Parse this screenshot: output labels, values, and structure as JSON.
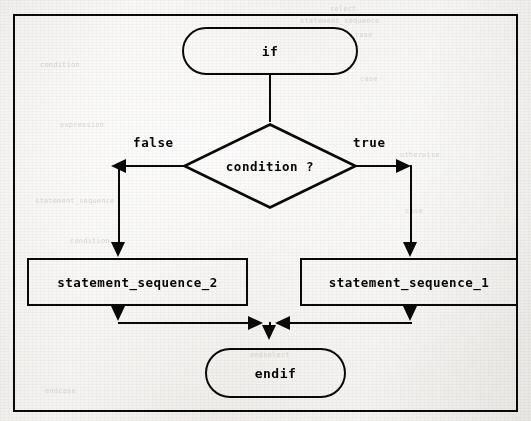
{
  "figure": {
    "kind": "flowchart",
    "frame_color": "#111111",
    "ink_color": "#101010",
    "paper_color": "#f2f1ef"
  },
  "nodes": {
    "start_terminal": {
      "label": "if",
      "shape": "stadium"
    },
    "decision": {
      "label": "condition ?",
      "shape": "diamond"
    },
    "false_branch_process": {
      "label": "statement_sequence_2",
      "shape": "rectangle"
    },
    "true_branch_process": {
      "label": "statement_sequence_1",
      "shape": "rectangle"
    },
    "end_terminal": {
      "label": "endif",
      "shape": "stadium"
    }
  },
  "edge_labels": {
    "false": "false",
    "true": "true"
  },
  "background_ghost_text": {
    "lines": [
      "select",
      "case",
      "case",
      "endcase",
      "endselect",
      "statement_sequence",
      "condition",
      "expression",
      "otherwise"
    ]
  }
}
